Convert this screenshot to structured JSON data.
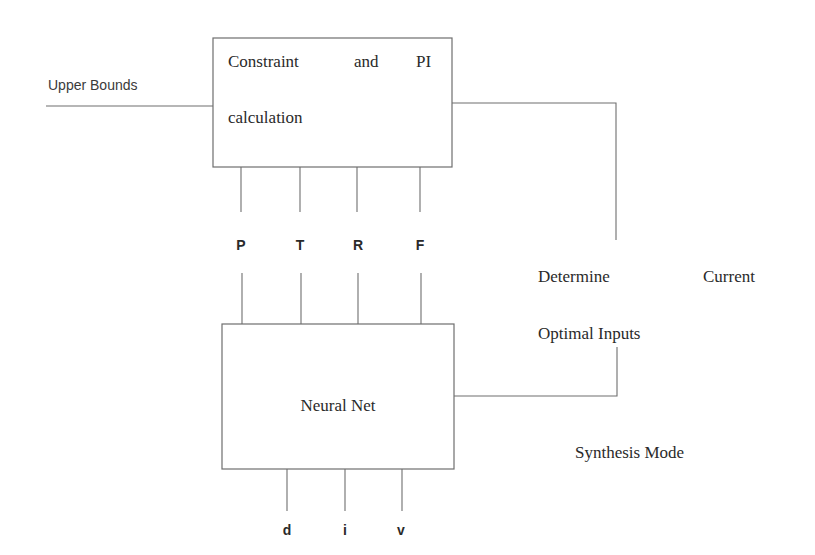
{
  "diagram": {
    "input_label": "Upper Bounds",
    "top_block": {
      "line1_word1": "Constraint",
      "line1_word2": "and",
      "line1_word3": "PI",
      "line2": "calculation"
    },
    "intermediate_signals": [
      "P",
      "T",
      "R",
      "F"
    ],
    "bottom_block": {
      "label": "Neural Net"
    },
    "outputs": [
      "d",
      "i",
      "v"
    ],
    "side_block": {
      "line1_word1": "Determine",
      "line1_word2": "Current",
      "line2": "Optimal Inputs"
    },
    "mode_label": "Synthesis Mode"
  }
}
